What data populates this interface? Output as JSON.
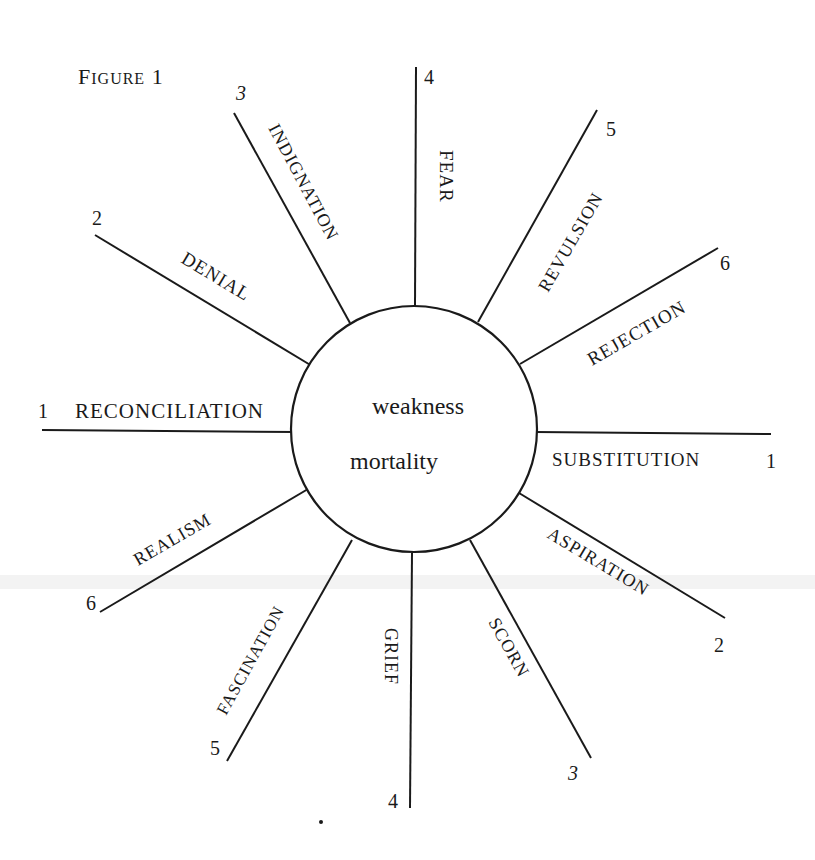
{
  "figure": {
    "title": "Figure 1",
    "center": {
      "line1": "weakness",
      "line2": "mortality"
    },
    "spokes": [
      {
        "id": "reconciliation",
        "label": "Reconciliation",
        "number": "1",
        "side": "left"
      },
      {
        "id": "denial",
        "label": "Denial",
        "number": "2",
        "side": "left"
      },
      {
        "id": "indignation",
        "label": "Indignation",
        "number": "3",
        "side": "left"
      },
      {
        "id": "fear",
        "label": "Fear",
        "number": "4",
        "side": "top"
      },
      {
        "id": "revulsion",
        "label": "Revulsion",
        "number": "5",
        "side": "right"
      },
      {
        "id": "rejection",
        "label": "Rejection",
        "number": "6",
        "side": "right"
      },
      {
        "id": "substitution",
        "label": "Substitution",
        "number": "1",
        "side": "right"
      },
      {
        "id": "aspiration",
        "label": "Aspiration",
        "number": "2",
        "side": "right"
      },
      {
        "id": "scorn",
        "label": "Scorn",
        "number": "3",
        "side": "right"
      },
      {
        "id": "grief",
        "label": "Grief",
        "number": "4",
        "side": "bottom"
      },
      {
        "id": "fascination",
        "label": "Fascination",
        "number": "5",
        "side": "left"
      },
      {
        "id": "realism",
        "label": "Realism",
        "number": "6",
        "side": "left"
      }
    ]
  },
  "colors": {
    "ink": "#1a1a1a",
    "paper": "#ffffff"
  }
}
